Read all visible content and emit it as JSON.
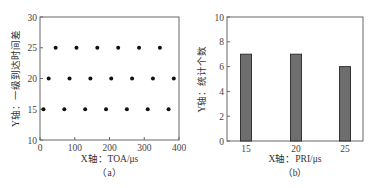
{
  "chart_data": [
    {
      "type": "scatter",
      "caption": "（a）",
      "xlabel": "X轴：TOA/μs",
      "ylabel": "Y轴：一级到达时间差",
      "xlim": [
        0,
        400
      ],
      "ylim": [
        10,
        30
      ],
      "xticks": [
        0,
        100,
        200,
        300,
        400
      ],
      "yticks": [
        10,
        15,
        20,
        25,
        30
      ],
      "grid": false,
      "marker_color": "#111111",
      "series": [
        {
          "name": "PRI=25",
          "y": 25,
          "x": [
            45,
            105,
            165,
            225,
            285,
            345
          ]
        },
        {
          "name": "PRI=20",
          "y": 20,
          "x": [
            25,
            85,
            145,
            205,
            265,
            325,
            385
          ]
        },
        {
          "name": "PRI=15",
          "y": 15,
          "x": [
            10,
            70,
            130,
            190,
            250,
            310,
            370
          ]
        }
      ]
    },
    {
      "type": "bar",
      "caption": "（b）",
      "xlabel": "X轴：PRI/μs",
      "ylabel": "Y轴：统计个数",
      "categories": [
        "15",
        "20",
        "25"
      ],
      "values": [
        7,
        7,
        6
      ],
      "ylim": [
        0,
        10
      ],
      "yticks": [
        0,
        2,
        4,
        6,
        8,
        10
      ],
      "grid": false,
      "bar_color": "#6e6e6e",
      "bar_edge_color": "#333333"
    }
  ]
}
